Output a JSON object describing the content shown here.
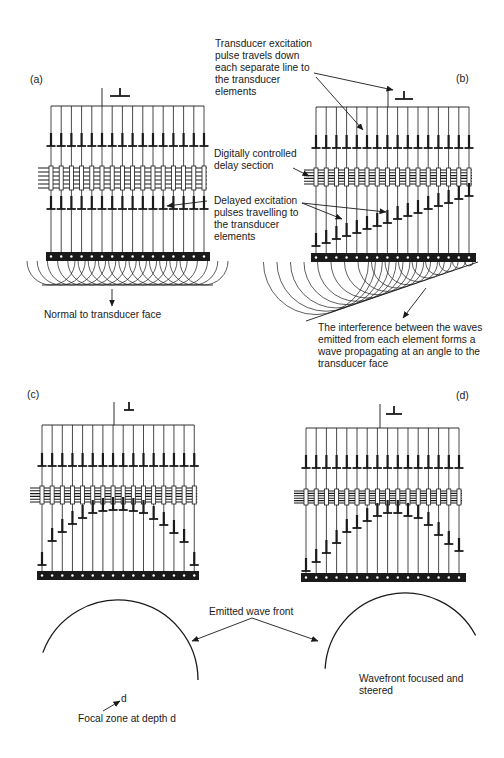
{
  "figure": {
    "stroke_color": "#1a1a1a",
    "panels": [
      {
        "id": "a",
        "label": "(a)",
        "label_pos": [
          30,
          78
        ],
        "elements": 16,
        "x0": 51,
        "dx": 10.2,
        "feed": {
          "x": 102,
          "y_top": 88,
          "bus_y": 106,
          "ground": [
            110,
            96,
            130
          ]
        },
        "top_pulse_y": 146,
        "delay_box": [
          166,
          190
        ],
        "delay_left": 38,
        "lower_pulses": [
          209,
          209,
          209,
          209,
          209,
          209,
          209,
          209,
          209,
          209,
          209,
          209,
          209,
          209,
          209,
          209
        ],
        "bar_y": 252,
        "bar_x": [
          46,
          210
        ],
        "waves": "planar",
        "wave_radius": 24,
        "baseline": {
          "x1": 42,
          "y1": 285,
          "x2": 213,
          "y2": 285
        },
        "normal_arrow": {
          "x": 112,
          "y1": 289,
          "y2": 306
        }
      },
      {
        "id": "b",
        "label": "(b)",
        "label_pos": [
          456,
          82
        ],
        "elements": 16,
        "x0": 316,
        "dx": 10.2,
        "feed": {
          "x": 388,
          "y_top": 88,
          "bus_y": 107,
          "ground": [
            395,
            99,
            413
          ]
        },
        "top_pulse_y": 148,
        "delay_box": [
          168,
          186
        ],
        "delay_left": 304,
        "lower_pulses": [
          246,
          243,
          239,
          236,
          233,
          229,
          226,
          223,
          219,
          216,
          213,
          209,
          206,
          203,
          199,
          196
        ],
        "bar_y": 253,
        "bar_x": [
          311,
          476
        ],
        "waves": "steered",
        "baseline": {
          "x1": 306,
          "y1": 321,
          "x2": 478,
          "y2": 262
        }
      },
      {
        "id": "c",
        "label": "(c)",
        "label_pos": [
          27,
          392
        ],
        "elements": 16,
        "x0": 42,
        "dx": 10.15,
        "feed": {
          "x": 114,
          "y_top": 402,
          "bus_y": 425,
          "ground": [
            124,
            410,
            134
          ]
        },
        "top_pulse_y": 466,
        "delay_box": [
          486,
          504
        ],
        "delay_left": 30,
        "lower_pulses": [
          565,
          541,
          532,
          524,
          518,
          513,
          511,
          510,
          510,
          511,
          513,
          519,
          525,
          533,
          542,
          565
        ],
        "bar_y": 571,
        "bar_x": [
          37,
          199
        ],
        "waves": "focused"
      },
      {
        "id": "d",
        "label": "(d)",
        "label_pos": [
          455,
          392
        ],
        "elements": 16,
        "x0": 306,
        "dx": 10.2,
        "feed": {
          "x": 380,
          "y_top": 404,
          "bus_y": 428,
          "ground": [
            386,
            414,
            402
          ]
        },
        "top_pulse_y": 468,
        "delay_box": [
          489,
          505
        ],
        "delay_left": 294,
        "lower_pulses": [
          571,
          562,
          553,
          543,
          532,
          528,
          521,
          516,
          513,
          513,
          516,
          518,
          525,
          535,
          544,
          551
        ],
        "bar_y": 573,
        "bar_x": [
          301,
          466
        ],
        "waves": "focused-steered"
      }
    ],
    "wavefronts": [
      {
        "name": "wavefront-c",
        "cx": 118,
        "cy": 680,
        "r": 80,
        "start_deg": 200,
        "end_deg": 360
      },
      {
        "name": "wavefront-d",
        "cx": 405,
        "cy": 673,
        "r": 80,
        "start_deg": 183,
        "end_deg": 332
      }
    ]
  },
  "labels": {
    "excitation": "Transducer excitation\npulse travels down\neach separate line to\nthe transducer\nelements",
    "delay_section": "Digitally controlled\ndelay section",
    "delayed_pulses": "Delayed excitation\npulses travelling to\nthe transducer\nelements",
    "normal": "Normal to transducer face",
    "interference": "The interference between the waves\nemitted from each element forms a\nwave propagating at an angle to the\ntransducer face",
    "emitted_wavefront": "Emitted wave front",
    "focused_steered": "Wavefront focused and\nsteered",
    "focal_zone": "Focal zone at depth d",
    "focal_d": "d"
  }
}
